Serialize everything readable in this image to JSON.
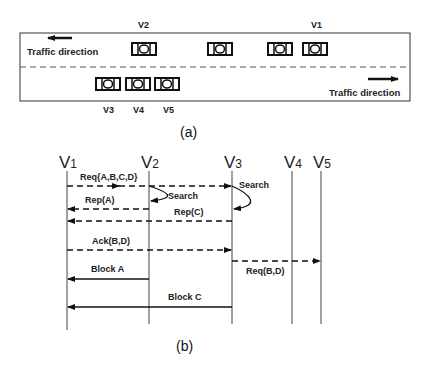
{
  "part_a": {
    "caption": "(a)",
    "upper_lane": {
      "direction_label": "Traffic direction",
      "direction": "left",
      "vehicles": [
        {
          "label": "V2"
        },
        {
          "label": ""
        },
        {
          "label": ""
        },
        {
          "label": "V1"
        }
      ]
    },
    "lower_lane": {
      "direction_label": "Traffic direction",
      "direction": "right",
      "vehicles": [
        {
          "label": "V3"
        },
        {
          "label": "V4"
        },
        {
          "label": "V5"
        }
      ]
    }
  },
  "part_b": {
    "caption": "(b)",
    "lifelines": [
      {
        "name": "V",
        "sub": "1"
      },
      {
        "name": "V",
        "sub": "2"
      },
      {
        "name": "V",
        "sub": "3"
      },
      {
        "name": "V",
        "sub": "4"
      },
      {
        "name": "V",
        "sub": "5"
      }
    ],
    "messages": [
      {
        "label": "Req{A,B,C,D}",
        "from": 0,
        "to": 2,
        "style": "dashed"
      },
      {
        "label": "Search",
        "at": 1,
        "style": "self"
      },
      {
        "label": "Search",
        "at": 2,
        "style": "self"
      },
      {
        "label": "Rep(A)",
        "from": 1,
        "to": 0,
        "style": "dashed"
      },
      {
        "label": "Rep(C)",
        "from": 2,
        "to": 0,
        "style": "dashed"
      },
      {
        "label": "Ack(B,D)",
        "from": 0,
        "to": 2,
        "style": "dashed"
      },
      {
        "label": "Req(B,D)",
        "from": 2,
        "to": 4,
        "style": "dashed"
      },
      {
        "label": "Block A",
        "from": 1,
        "to": 0,
        "style": "solid"
      },
      {
        "label": "Block C",
        "from": 2,
        "to": 0,
        "style": "solid"
      }
    ]
  }
}
